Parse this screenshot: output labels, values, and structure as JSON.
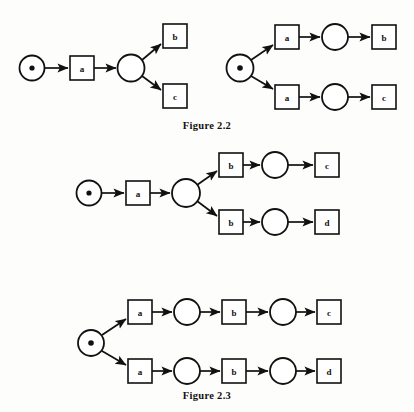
{
  "document": {
    "background_color": "#fdfdfb",
    "ink_color": "#111111",
    "captions": [
      {
        "id": "figure-2-2",
        "text": "Figure 2.2"
      },
      {
        "id": "figure-2-3",
        "text": "Figure 2.3"
      }
    ]
  },
  "figures": [
    {
      "id": "figure-2-2",
      "caption": "Figure 2.2",
      "diagrams": [
        {
          "id": "fig22-left",
          "description": "choice-after-single-transition",
          "places": [
            {
              "name": "start-place",
              "marked": true,
              "cx": 32,
              "cy": 68,
              "r": 12.5,
              "token_r": 2.6
            },
            {
              "name": "choice-place",
              "marked": false,
              "cx": 131,
              "cy": 68,
              "r": 13.5,
              "token_r": 0
            }
          ],
          "transitions": [
            {
              "name": "transition-a",
              "label": "a",
              "x": 70,
              "y": 56,
              "w": 24,
              "h": 24
            },
            {
              "name": "transition-b",
              "label": "b",
              "x": 163,
              "y": 24,
              "w": 24,
              "h": 24
            },
            {
              "name": "transition-c",
              "label": "c",
              "x": 163,
              "y": 84,
              "w": 24,
              "h": 24
            }
          ],
          "arcs": [
            {
              "name": "arc-start-to-a",
              "x1": 45,
              "y1": 68,
              "x2": 68,
              "y2": 68
            },
            {
              "name": "arc-a-to-choice",
              "x1": 94,
              "y1": 68,
              "x2": 116,
              "y2": 68
            },
            {
              "name": "arc-choice-to-b",
              "x1": 142,
              "y1": 60,
              "x2": 161,
              "y2": 44
            },
            {
              "name": "arc-choice-to-c",
              "x1": 142,
              "y1": 76,
              "x2": 161,
              "y2": 90
            }
          ]
        },
        {
          "id": "fig22-right",
          "description": "choice-at-start-place",
          "places": [
            {
              "name": "start-place",
              "marked": true,
              "cx": 240,
              "cy": 68,
              "r": 13.5,
              "token_r": 2.8
            },
            {
              "name": "place-upper",
              "marked": false,
              "cx": 335,
              "cy": 37,
              "r": 13,
              "token_r": 0
            },
            {
              "name": "place-lower",
              "marked": false,
              "cx": 335,
              "cy": 97,
              "r": 13,
              "token_r": 0
            }
          ],
          "transitions": [
            {
              "name": "transition-a-upper",
              "label": "a",
              "x": 275,
              "y": 25,
              "w": 24,
              "h": 24
            },
            {
              "name": "transition-a-lower",
              "label": "a",
              "x": 275,
              "y": 85,
              "w": 24,
              "h": 24
            },
            {
              "name": "transition-b",
              "label": "b",
              "x": 372,
              "y": 25,
              "w": 24,
              "h": 24
            },
            {
              "name": "transition-c",
              "label": "c",
              "x": 372,
              "y": 85,
              "w": 24,
              "h": 24
            }
          ],
          "arcs": [
            {
              "name": "arc-start-to-a-upper",
              "x1": 251,
              "y1": 60,
              "x2": 273,
              "y2": 45
            },
            {
              "name": "arc-start-to-a-lower",
              "x1": 251,
              "y1": 76,
              "x2": 273,
              "y2": 89
            },
            {
              "name": "arc-a-upper-to-place",
              "x1": 299,
              "y1": 37,
              "x2": 320,
              "y2": 37
            },
            {
              "name": "arc-a-lower-to-place",
              "x1": 299,
              "y1": 97,
              "x2": 320,
              "y2": 97
            },
            {
              "name": "arc-place-to-b",
              "x1": 348,
              "y1": 37,
              "x2": 370,
              "y2": 37
            },
            {
              "name": "arc-place-to-c",
              "x1": 348,
              "y1": 97,
              "x2": 370,
              "y2": 97
            }
          ]
        }
      ]
    },
    {
      "id": "figure-2-3",
      "caption": "Figure 2.3",
      "diagrams": [
        {
          "id": "fig23-top",
          "description": "choice-after-a-then-b-branches",
          "places": [
            {
              "name": "start-place",
              "marked": true,
              "cx": 89,
              "cy": 193,
              "r": 12.5,
              "token_r": 2.6
            },
            {
              "name": "choice-place",
              "marked": false,
              "cx": 186,
              "cy": 193,
              "r": 14,
              "token_r": 0
            },
            {
              "name": "place-upper",
              "marked": false,
              "cx": 275,
              "cy": 165,
              "r": 13,
              "token_r": 0
            },
            {
              "name": "place-lower",
              "marked": false,
              "cx": 275,
              "cy": 222,
              "r": 13,
              "token_r": 0
            }
          ],
          "transitions": [
            {
              "name": "transition-a",
              "label": "a",
              "x": 126,
              "y": 181,
              "w": 24,
              "h": 24
            },
            {
              "name": "transition-b-upper",
              "label": "b",
              "x": 219,
              "y": 153,
              "w": 24,
              "h": 24
            },
            {
              "name": "transition-b-lower",
              "label": "b",
              "x": 219,
              "y": 210,
              "w": 24,
              "h": 24
            },
            {
              "name": "transition-c",
              "label": "c",
              "x": 315,
              "y": 153,
              "w": 24,
              "h": 24
            },
            {
              "name": "transition-d",
              "label": "d",
              "x": 315,
              "y": 210,
              "w": 24,
              "h": 24
            }
          ],
          "arcs": [
            {
              "name": "arc-start-to-a",
              "x1": 102,
              "y1": 193,
              "x2": 124,
              "y2": 193
            },
            {
              "name": "arc-a-to-choice",
              "x1": 150,
              "y1": 193,
              "x2": 170,
              "y2": 193
            },
            {
              "name": "arc-choice-to-b-upper",
              "x1": 197,
              "y1": 185,
              "x2": 217,
              "y2": 171
            },
            {
              "name": "arc-choice-to-b-lower",
              "x1": 197,
              "y1": 201,
              "x2": 217,
              "y2": 216
            },
            {
              "name": "arc-b-upper-to-place",
              "x1": 243,
              "y1": 165,
              "x2": 260,
              "y2": 165
            },
            {
              "name": "arc-b-lower-to-place",
              "x1": 243,
              "y1": 222,
              "x2": 260,
              "y2": 222
            },
            {
              "name": "arc-place-to-c",
              "x1": 288,
              "y1": 165,
              "x2": 313,
              "y2": 165
            },
            {
              "name": "arc-place-to-d",
              "x1": 288,
              "y1": 222,
              "x2": 313,
              "y2": 222
            }
          ]
        },
        {
          "id": "fig23-bottom",
          "description": "choice-at-start-two-full-sequences",
          "places": [
            {
              "name": "start-place",
              "marked": true,
              "cx": 91,
              "cy": 343,
              "r": 13,
              "token_r": 2.8
            },
            {
              "name": "place-upper-1",
              "marked": false,
              "cx": 187,
              "cy": 312,
              "r": 13,
              "token_r": 0
            },
            {
              "name": "place-lower-1",
              "marked": false,
              "cx": 187,
              "cy": 371,
              "r": 13,
              "token_r": 0
            },
            {
              "name": "place-upper-2",
              "marked": false,
              "cx": 283,
              "cy": 312,
              "r": 13,
              "token_r": 0
            },
            {
              "name": "place-lower-2",
              "marked": false,
              "cx": 283,
              "cy": 371,
              "r": 13,
              "token_r": 0
            }
          ],
          "transitions": [
            {
              "name": "transition-a-upper",
              "label": "a",
              "x": 128,
              "y": 300,
              "w": 24,
              "h": 24
            },
            {
              "name": "transition-a-lower",
              "label": "a",
              "x": 128,
              "y": 359,
              "w": 24,
              "h": 24
            },
            {
              "name": "transition-b-upper",
              "label": "b",
              "x": 222,
              "y": 300,
              "w": 24,
              "h": 24
            },
            {
              "name": "transition-b-lower",
              "label": "b",
              "x": 222,
              "y": 359,
              "w": 24,
              "h": 24
            },
            {
              "name": "transition-c",
              "label": "c",
              "x": 317,
              "y": 300,
              "w": 24,
              "h": 24
            },
            {
              "name": "transition-d",
              "label": "d",
              "x": 317,
              "y": 359,
              "w": 24,
              "h": 24
            }
          ],
          "arcs": [
            {
              "name": "arc-start-to-a-upper",
              "x1": 102,
              "y1": 335,
              "x2": 126,
              "y2": 319
            },
            {
              "name": "arc-start-to-a-lower",
              "x1": 102,
              "y1": 351,
              "x2": 126,
              "y2": 365
            },
            {
              "name": "arc-a-upper-to-place",
              "x1": 152,
              "y1": 312,
              "x2": 172,
              "y2": 312
            },
            {
              "name": "arc-a-lower-to-place",
              "x1": 152,
              "y1": 371,
              "x2": 172,
              "y2": 371
            },
            {
              "name": "arc-place-to-b-upper",
              "x1": 200,
              "y1": 312,
              "x2": 220,
              "y2": 312
            },
            {
              "name": "arc-place-to-b-lower",
              "x1": 200,
              "y1": 371,
              "x2": 220,
              "y2": 371
            },
            {
              "name": "arc-b-upper-to-place",
              "x1": 246,
              "y1": 312,
              "x2": 268,
              "y2": 312
            },
            {
              "name": "arc-b-lower-to-place",
              "x1": 246,
              "y1": 371,
              "x2": 268,
              "y2": 371
            },
            {
              "name": "arc-place-to-c",
              "x1": 296,
              "y1": 312,
              "x2": 315,
              "y2": 312
            },
            {
              "name": "arc-place-to-d",
              "x1": 296,
              "y1": 371,
              "x2": 315,
              "y2": 371
            }
          ]
        }
      ]
    }
  ]
}
